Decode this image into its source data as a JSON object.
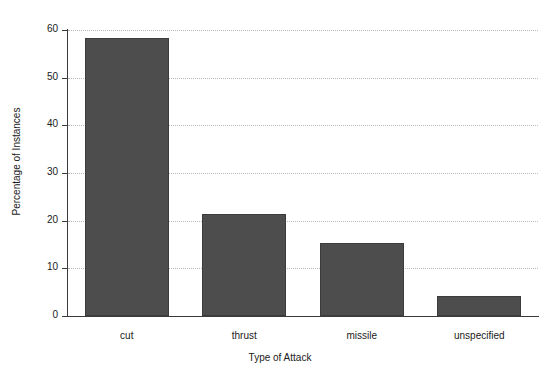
{
  "chart_data": {
    "type": "bar",
    "title": "",
    "xlabel": "Type of Attack",
    "ylabel": "Percentage of Instances",
    "categories": [
      "cut",
      "thrust",
      "missile",
      "unspecified"
    ],
    "values": [
      58.3,
      21.5,
      15.4,
      4.3
    ],
    "ylim": [
      0,
      60
    ],
    "yticks": [
      0,
      10,
      20,
      30,
      40,
      50,
      60
    ],
    "ytick_labels": [
      "0",
      "10",
      "20",
      "30",
      "40",
      "50",
      "60"
    ],
    "grid": true,
    "grid_style": "dotted",
    "grid_axis": "y",
    "legend": false,
    "bar_color": "#4d4d4d",
    "bar_edge_color": "#3c3c3c",
    "axis_color": "#3b3b3b",
    "grid_color": "#b9b9b9",
    "background_color": "#ffffff"
  }
}
